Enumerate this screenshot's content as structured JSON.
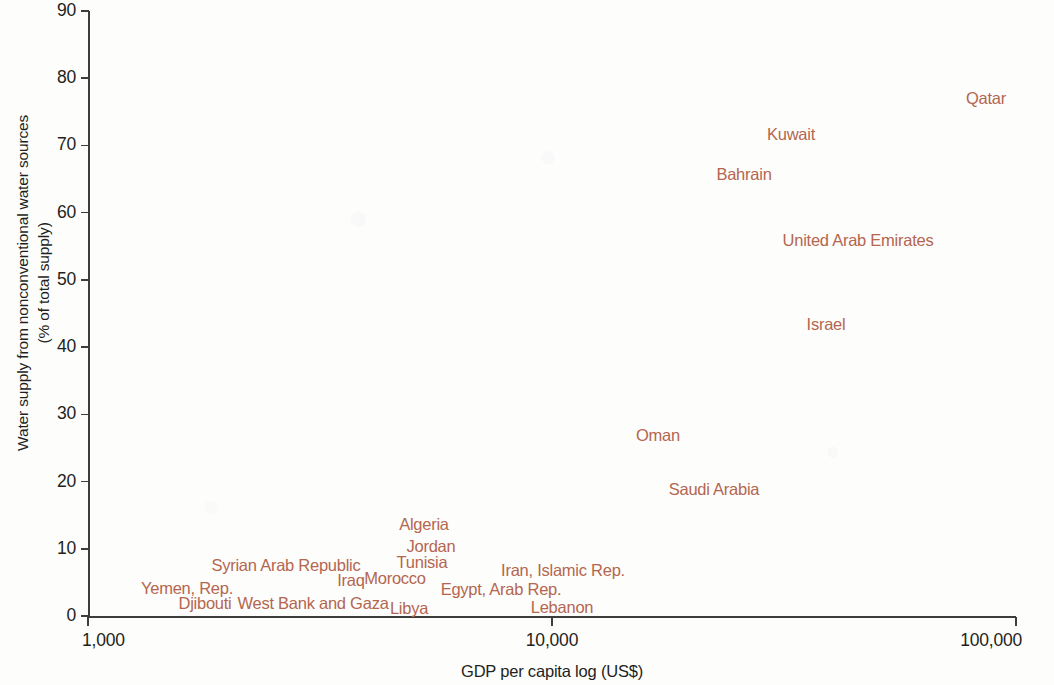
{
  "chart_data": {
    "type": "scatter",
    "title": "",
    "xlabel": "GDP per capita log (US$)",
    "ylabel_line1": "Water supply from nonconventional water sources",
    "ylabel_line2": "(% of total supply)",
    "xscale": "log",
    "xlim": [
      1000,
      100000
    ],
    "ylim": [
      0,
      90
    ],
    "grid": false,
    "legend": "none",
    "xticks": [
      "1,000",
      "10,000",
      "100,000"
    ],
    "xtick_values": [
      1000,
      10000,
      100000
    ],
    "yticks": [
      "0",
      "10",
      "20",
      "30",
      "40",
      "50",
      "60",
      "70",
      "80",
      "90"
    ],
    "ytick_values": [
      0,
      10,
      20,
      30,
      40,
      50,
      60,
      70,
      80,
      90
    ],
    "label_color": "#b4664f",
    "axis_color": "#3d3d3d",
    "marker": "text-label-only",
    "points": [
      {
        "name": "Qatar",
        "x": 73000,
        "y": 78.0,
        "px": 986,
        "py": 98
      },
      {
        "name": "Kuwait",
        "x": 30000,
        "y": 71.5,
        "px": 791,
        "py": 134
      },
      {
        "name": "Bahrain",
        "x": 21500,
        "y": 65.5,
        "px": 744,
        "py": 174
      },
      {
        "name": "United Arab Emirates",
        "x": 38000,
        "y": 56.0,
        "px": 858,
        "py": 240
      },
      {
        "name": "Israel",
        "x": 35000,
        "y": 43.5,
        "px": 826,
        "py": 324
      },
      {
        "name": "Oman",
        "x": 17500,
        "y": 27.5,
        "px": 658,
        "py": 435
      },
      {
        "name": "Saudi Arabia",
        "x": 21000,
        "y": 20.0,
        "px": 714,
        "py": 489
      },
      {
        "name": "Algeria",
        "x": 5400,
        "y": 14.0,
        "px": 424,
        "py": 524
      },
      {
        "name": "Jordan",
        "x": 5600,
        "y": 10.7,
        "px": 431,
        "py": 546
      },
      {
        "name": "Tunisia",
        "x": 5400,
        "y": 8.3,
        "px": 422,
        "py": 562
      },
      {
        "name": "Iran, Islamic Rep.",
        "x": 9200,
        "y": 7.3,
        "px": 563,
        "py": 570
      },
      {
        "name": "Syrian Arab Republic",
        "x": 2600,
        "y": 7.8,
        "px": 286,
        "py": 565
      },
      {
        "name": "Morocco",
        "x": 4700,
        "y": 5.9,
        "px": 395,
        "py": 578
      },
      {
        "name": "Iraq",
        "x": 4100,
        "y": 5.6,
        "px": 351,
        "py": 580
      },
      {
        "name": "Yemen, Rep.",
        "x": 1750,
        "y": 4.5,
        "px": 187,
        "py": 588
      },
      {
        "name": "Egypt, Arab Rep.",
        "x": 7300,
        "y": 4.4,
        "px": 501,
        "py": 589
      },
      {
        "name": "Djibouti",
        "x": 2000,
        "y": 2.3,
        "px": 205,
        "py": 603
      },
      {
        "name": "West Bank and Gaza",
        "x": 3100,
        "y": 2.3,
        "px": 313,
        "py": 603
      },
      {
        "name": "Libya",
        "x": 5000,
        "y": 1.5,
        "px": 409,
        "py": 608
      },
      {
        "name": "Lebanon",
        "x": 10000,
        "y": 1.6,
        "px": 562,
        "py": 607
      }
    ]
  }
}
